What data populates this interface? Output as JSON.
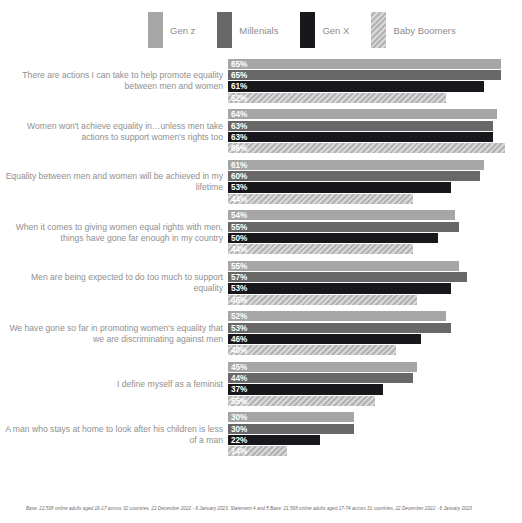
{
  "chart_data": {
    "type": "bar",
    "orientation": "horizontal",
    "title": "",
    "xlabel": "",
    "ylabel": "",
    "xlim": [
      0,
      70
    ],
    "grid": false,
    "legend_position": "top",
    "value_suffix": "%",
    "categories": [
      "There are actions I can take to help promote equality between men and women",
      "Women won't achieve equality in…unless men take actions to support women's rights too",
      "Equality between men and women will be achieved in my lifetime",
      "When it comes to giving women equal rights with men, things have gone far enough in my country",
      "Men are being expected to do too much to support equality",
      "We have gone so far in promoting women's equality that we are discriminating against men",
      "I define myself as a feminist",
      "A man who stays at home to look after his children is less of a man"
    ],
    "series": [
      {
        "name": "Gen z",
        "color": "#a6a6a6",
        "pattern": "solid",
        "values": [
          65,
          64,
          61,
          54,
          55,
          52,
          45,
          30
        ]
      },
      {
        "name": "Millenials",
        "color": "#686868",
        "pattern": "solid",
        "values": [
          65,
          63,
          60,
          55,
          57,
          53,
          44,
          30
        ]
      },
      {
        "name": "Gen X",
        "color": "#18171c",
        "pattern": "solid",
        "values": [
          61,
          63,
          53,
          50,
          53,
          46,
          37,
          22
        ]
      },
      {
        "name": "Baby Boomers",
        "color": "#b4b4b4",
        "pattern": "diagonal-hatch",
        "values": [
          52,
          66,
          44,
          44,
          45,
          40,
          55,
          14
        ]
      }
    ],
    "bar_lengths": {
      "note": "rendered bar pixel lengths differ from labels for Baby Boomers rows 3,4,6,7,8",
      "series_3_drawn": [
        52,
        66,
        44,
        44,
        45,
        40,
        35,
        14
      ]
    }
  },
  "legend": {
    "items": [
      {
        "label": "Gen z"
      },
      {
        "label": "Millenials"
      },
      {
        "label": "Gen X"
      },
      {
        "label": "Baby Boomers"
      }
    ]
  },
  "footnote": {
    "text": "Base: 22,508 online adults aged 16-17 across 32 countries, 22 December 2022 - 6 January 2023. Statement 4 and 5 Base: 21,508 online adults aged 17-74 across 31 countries, 22 December 2022 -  6 January 2023"
  }
}
